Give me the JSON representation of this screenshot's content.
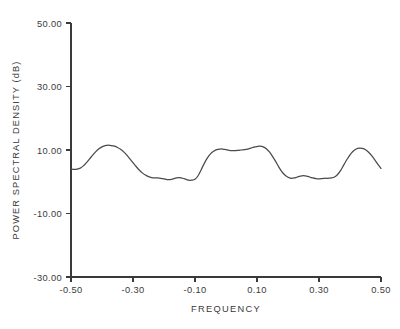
{
  "chart_data": {
    "type": "line",
    "title": "",
    "xlabel": "FREQUENCY",
    "ylabel": "POWER SPECTRAL DENSITY (dB)",
    "xlim": [
      -0.5,
      0.5
    ],
    "ylim": [
      -30.0,
      50.0
    ],
    "grid": false,
    "legend": null,
    "xticks": [
      -0.5,
      -0.3,
      -0.1,
      0.1,
      0.3,
      0.5
    ],
    "xtick_labels": [
      "-0.50",
      "-0.30",
      "-0.10",
      "0.10",
      "0.30",
      "0.50"
    ],
    "yticks": [
      -30.0,
      -10.0,
      10.0,
      30.0,
      50.0
    ],
    "ytick_labels": [
      "-30.00",
      "-10.00",
      "10.00",
      "30.00",
      "50.00"
    ],
    "line_color": "#4a4a4a",
    "series": [
      {
        "name": "power spectral density",
        "x": [
          -0.5,
          -0.49,
          -0.48,
          -0.47,
          -0.46,
          -0.45,
          -0.44,
          -0.43,
          -0.42,
          -0.41,
          -0.4,
          -0.39,
          -0.38,
          -0.37,
          -0.36,
          -0.35,
          -0.34,
          -0.33,
          -0.32,
          -0.31,
          -0.3,
          -0.29,
          -0.28,
          -0.27,
          -0.26,
          -0.25,
          -0.24,
          -0.23,
          -0.22,
          -0.21,
          -0.2,
          -0.19,
          -0.18,
          -0.17,
          -0.16,
          -0.15,
          -0.14,
          -0.13,
          -0.12,
          -0.11,
          -0.1,
          -0.09,
          -0.08,
          -0.07,
          -0.06,
          -0.05,
          -0.04,
          -0.03,
          -0.02,
          -0.01,
          0.0,
          0.01,
          0.02,
          0.03,
          0.04,
          0.05,
          0.06,
          0.07,
          0.08,
          0.09,
          0.1,
          0.11,
          0.12,
          0.13,
          0.14,
          0.15,
          0.16,
          0.17,
          0.18,
          0.19,
          0.2,
          0.21,
          0.22,
          0.23,
          0.24,
          0.25,
          0.26,
          0.27,
          0.28,
          0.29,
          0.3,
          0.31,
          0.32,
          0.33,
          0.34,
          0.35,
          0.36,
          0.37,
          0.38,
          0.39,
          0.4,
          0.41,
          0.42,
          0.43,
          0.44,
          0.45,
          0.46,
          0.47,
          0.48,
          0.49,
          0.5
        ],
        "y": [
          4.0,
          3.9,
          4.0,
          4.3,
          5.0,
          6.0,
          7.2,
          8.4,
          9.5,
          10.4,
          11.0,
          11.4,
          11.5,
          11.4,
          11.2,
          10.8,
          10.2,
          9.4,
          8.4,
          7.2,
          6.0,
          4.8,
          3.7,
          2.8,
          2.1,
          1.6,
          1.3,
          1.2,
          1.2,
          1.1,
          0.9,
          0.7,
          0.7,
          0.9,
          1.2,
          1.3,
          1.1,
          0.8,
          0.5,
          0.5,
          0.8,
          1.9,
          3.8,
          5.8,
          7.5,
          8.8,
          9.6,
          10.1,
          10.3,
          10.3,
          10.1,
          9.9,
          9.8,
          9.8,
          9.9,
          10.0,
          10.1,
          10.3,
          10.6,
          10.9,
          11.1,
          11.2,
          11.0,
          10.4,
          9.4,
          8.0,
          6.4,
          4.7,
          3.2,
          2.1,
          1.4,
          1.1,
          1.2,
          1.5,
          1.8,
          1.9,
          1.8,
          1.5,
          1.2,
          1.0,
          0.9,
          1.0,
          1.1,
          1.1,
          1.2,
          1.5,
          2.3,
          3.6,
          5.3,
          7.0,
          8.5,
          9.6,
          10.3,
          10.6,
          10.5,
          10.1,
          9.3,
          8.2,
          6.9,
          5.5,
          4.2
        ]
      }
    ]
  },
  "axis_labels": {
    "x_title": "FREQUENCY",
    "y_title": "POWER SPECTRAL DENSITY (dB)"
  },
  "ytick_labels": [
    "50.00",
    "30.00",
    "10.00",
    "-10.00",
    "-30.00"
  ],
  "xtick_labels": [
    "-0.50",
    "-0.30",
    "-0.10",
    "0.10",
    "0.30",
    "0.50"
  ]
}
